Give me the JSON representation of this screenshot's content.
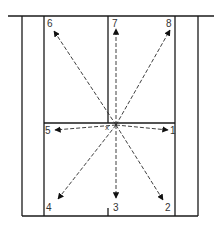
{
  "diagram": {
    "type": "court-movement-diagram",
    "center_marker": "x",
    "origin": {
      "x": 116,
      "y": 125
    },
    "directions": [
      {
        "id": "1",
        "label": "1",
        "end": {
          "x": 168,
          "y": 130
        },
        "label_pos": {
          "x": 170,
          "y": 134
        }
      },
      {
        "id": "2",
        "label": "2",
        "end": {
          "x": 163,
          "y": 200
        },
        "label_pos": {
          "x": 165,
          "y": 211
        }
      },
      {
        "id": "3",
        "label": "3",
        "end": {
          "x": 116,
          "y": 198
        },
        "label_pos": {
          "x": 113,
          "y": 211
        }
      },
      {
        "id": "4",
        "label": "4",
        "end": {
          "x": 58,
          "y": 199
        },
        "label_pos": {
          "x": 46,
          "y": 211
        }
      },
      {
        "id": "5",
        "label": "5",
        "end": {
          "x": 55,
          "y": 130
        },
        "label_pos": {
          "x": 45,
          "y": 134
        }
      },
      {
        "id": "6",
        "label": "6",
        "end": {
          "x": 54,
          "y": 31
        },
        "label_pos": {
          "x": 47,
          "y": 27
        }
      },
      {
        "id": "7",
        "label": "7",
        "end": {
          "x": 116,
          "y": 29
        },
        "label_pos": {
          "x": 112,
          "y": 27
        }
      },
      {
        "id": "8",
        "label": "8",
        "end": {
          "x": 170,
          "y": 30
        },
        "label_pos": {
          "x": 166,
          "y": 27
        }
      }
    ],
    "colors": {
      "lines": "#1a1a1a",
      "arrows": "#2a2a2a",
      "background": "#ffffff"
    }
  }
}
